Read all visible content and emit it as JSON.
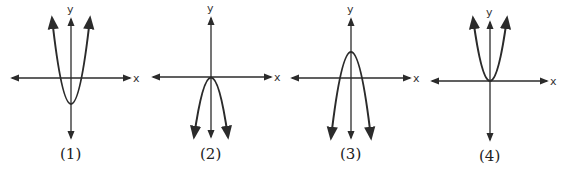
{
  "figure": {
    "type": "set of four parabola graphs",
    "graphs": [
      {
        "caption": "(1)",
        "x_label": "x",
        "y_label": "y",
        "description": "upward-opening parabola, vertex below origin on y-axis",
        "opens": "up",
        "vertex": "below x-axis on y-axis"
      },
      {
        "caption": "(2)",
        "x_label": "x",
        "y_label": "y",
        "description": "downward-opening parabola, vertex at origin",
        "opens": "down",
        "vertex": "origin"
      },
      {
        "caption": "(3)",
        "x_label": "x",
        "y_label": "y",
        "description": "downward-opening parabola, vertex above origin on y-axis",
        "opens": "down",
        "vertex": "above x-axis on y-axis"
      },
      {
        "caption": "(4)",
        "x_label": "x",
        "y_label": "y",
        "description": "upward-opening parabola, vertex at origin",
        "opens": "up",
        "vertex": "origin"
      }
    ],
    "colors": {
      "stroke": "#2b2b2b",
      "background": "#ffffff"
    }
  }
}
